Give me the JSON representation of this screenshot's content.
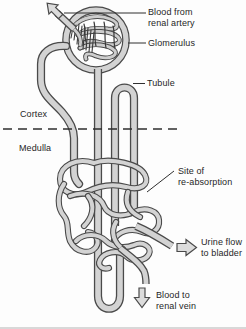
{
  "diagram": {
    "labels": {
      "blood_from_renal_artery": {
        "line1": "Blood from",
        "line2": "renal artery"
      },
      "glomerulus": "Glomerulus",
      "tubule": "Tubule",
      "cortex": "Cortex",
      "medulla": "Medulla",
      "site_of_reabsorption": {
        "line1": "Site of",
        "line2": "re-absorption"
      },
      "urine_flow_to_bladder": {
        "line1": "Urine flow",
        "line2": "to bladder"
      },
      "blood_to_renal_vein": {
        "line1": "Blood to",
        "line2": "renal vein"
      }
    },
    "colors": {
      "background": "#fdfdfd",
      "tube_fill": "#d3d3d3",
      "tube_outline": "#4a4a4a",
      "arrow_fill": "#dcdcdc",
      "text": "#262626",
      "dashed_line": "#2f2f2f"
    }
  }
}
